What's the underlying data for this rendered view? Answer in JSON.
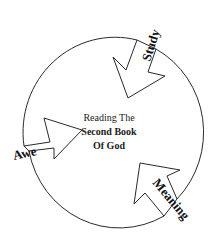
{
  "diagram": {
    "type": "cycle",
    "center": {
      "line1": "Reading The",
      "line2": "Second Book",
      "line3": "Of God"
    },
    "stages": [
      {
        "label": "Study",
        "position": "top-right"
      },
      {
        "label": "Meaning",
        "position": "bottom-right"
      },
      {
        "label": "Awe",
        "position": "left"
      }
    ],
    "colors": {
      "stroke": "#2a2a2a",
      "text": "#111111",
      "background": "#ffffff"
    }
  }
}
